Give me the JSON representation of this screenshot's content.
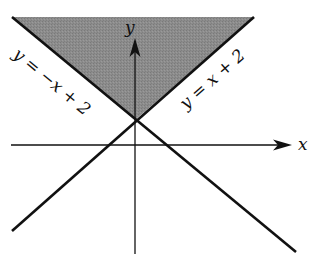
{
  "diagram": {
    "type": "coordinate-plane-inequality",
    "colors": {
      "shade": "#8a8a8a",
      "line": "#111111",
      "background": "#ffffff"
    },
    "axes": {
      "x_label": "x",
      "y_label": "y"
    },
    "lines": [
      {
        "id": "left-line",
        "label": "y = −x + 2",
        "equation": "y = -x + 2"
      },
      {
        "id": "right-line",
        "label": "y = x + 2",
        "equation": "y = x + 2"
      }
    ],
    "vertex": {
      "x": 0,
      "y": 2
    },
    "shaded_region": "y >= x + 2 and y >= -x + 2"
  }
}
